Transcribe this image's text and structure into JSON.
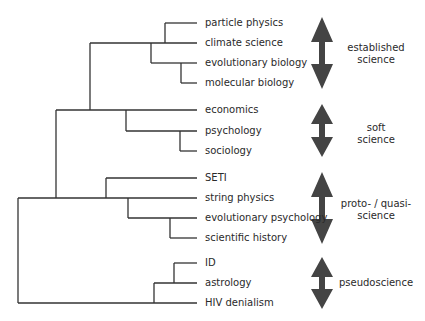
{
  "diagram": {
    "type": "dendrogram",
    "line_color": "#333333",
    "arrow_color": "#444444",
    "leaves": [
      {
        "label": "particle physics",
        "y": 23
      },
      {
        "label": "climate science",
        "y": 43
      },
      {
        "label": "evolutionary biology",
        "y": 63
      },
      {
        "label": "molecular biology",
        "y": 83
      },
      {
        "label": "economics",
        "y": 110
      },
      {
        "label": "psychology",
        "y": 131
      },
      {
        "label": "sociology",
        "y": 151
      },
      {
        "label": "SETI",
        "y": 178
      },
      {
        "label": "string physics",
        "y": 198
      },
      {
        "label": "evolutionary psychology",
        "y": 218
      },
      {
        "label": "scientific history",
        "y": 238
      },
      {
        "label": "ID",
        "y": 263
      },
      {
        "label": "astrology",
        "y": 283
      },
      {
        "label": "HIV denialism",
        "y": 303
      }
    ],
    "categories": [
      {
        "line1": "established",
        "line2": "science"
      },
      {
        "line1": "soft",
        "line2": "science"
      },
      {
        "line1": "proto- / quasi-",
        "line2": "science"
      },
      {
        "line1": "pseudoscience",
        "line2": ""
      }
    ]
  }
}
